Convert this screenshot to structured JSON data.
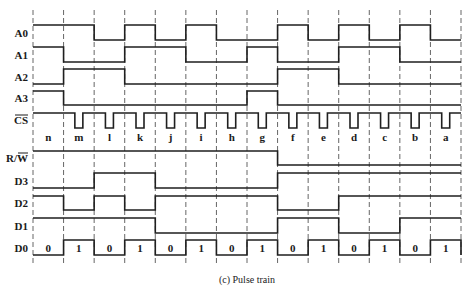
{
  "figure": {
    "caption": "(c) Pulse train",
    "grid": {
      "x_start": 33,
      "x_end": 461,
      "intervals": 14,
      "y_top": 10,
      "y_bottom": 265
    },
    "segments": [
      "n",
      "m",
      "l",
      "k",
      "j",
      "i",
      "h",
      "g",
      "f",
      "e",
      "d",
      "c",
      "b",
      "a"
    ],
    "signals": [
      {
        "name": "A0",
        "label": "A0",
        "overbar": false,
        "high_y": 25,
        "low_y": 40,
        "label_y": 37,
        "levels": [
          1,
          1,
          0,
          1,
          0,
          1,
          0,
          0,
          1,
          0,
          1,
          0,
          1,
          0
        ]
      },
      {
        "name": "A1",
        "label": "A1",
        "overbar": false,
        "high_y": 47,
        "low_y": 62,
        "label_y": 59,
        "levels": [
          1,
          0,
          0,
          1,
          1,
          0,
          0,
          1,
          0,
          0,
          1,
          1,
          0,
          0
        ]
      },
      {
        "name": "A2",
        "label": "A2",
        "overbar": false,
        "high_y": 69,
        "low_y": 84,
        "label_y": 81,
        "levels": [
          0,
          1,
          1,
          0,
          0,
          0,
          0,
          0,
          1,
          1,
          0,
          0,
          0,
          0
        ]
      },
      {
        "name": "A3",
        "label": "A3",
        "overbar": false,
        "high_y": 91,
        "low_y": 105,
        "label_y": 102,
        "levels": [
          1,
          0,
          0,
          0,
          0,
          0,
          0,
          1,
          0,
          0,
          0,
          0,
          0,
          0
        ]
      },
      {
        "name": "CS",
        "label": "CS",
        "overbar": true,
        "high_y": 113,
        "low_y": 128,
        "label_y": 124,
        "type": "pulse",
        "pulse_segments": [
          1,
          2,
          3,
          4,
          5,
          6,
          7,
          8,
          9,
          10,
          11,
          12,
          13
        ],
        "pulse_width": 8
      },
      {
        "name": "RW",
        "label": "R/W",
        "overbar_part": "W",
        "high_y": 151,
        "low_y": 165,
        "label_y": 162,
        "levels": [
          1,
          1,
          1,
          1,
          1,
          1,
          1,
          1,
          0,
          0,
          0,
          0,
          0,
          0
        ]
      },
      {
        "name": "D3",
        "label": "D3",
        "overbar": false,
        "high_y": 173,
        "low_y": 188,
        "label_y": 185,
        "levels": [
          0,
          0,
          1,
          1,
          0,
          0,
          0,
          0,
          1,
          1,
          1,
          1,
          1,
          1
        ]
      },
      {
        "name": "D2",
        "label": "D2",
        "overbar": false,
        "high_y": 196,
        "low_y": 210,
        "label_y": 207,
        "levels": [
          1,
          0,
          1,
          0,
          1,
          1,
          1,
          1,
          0,
          0,
          1,
          1,
          1,
          1
        ]
      },
      {
        "name": "D1",
        "label": "D1",
        "overbar": false,
        "high_y": 218,
        "low_y": 233,
        "label_y": 230,
        "levels": [
          1,
          1,
          1,
          1,
          0,
          0,
          0,
          0,
          1,
          1,
          0,
          0,
          1,
          1
        ]
      },
      {
        "name": "D0",
        "label": "D0",
        "overbar": false,
        "high_y": 240,
        "low_y": 255,
        "label_y": 252,
        "levels": [
          0,
          1,
          0,
          1,
          0,
          1,
          0,
          1,
          0,
          1,
          0,
          1,
          0,
          1
        ],
        "bit_labels": [
          "0",
          "1",
          "0",
          "1",
          "0",
          "1",
          "0",
          "1",
          "0",
          "1",
          "0",
          "1",
          "0",
          "1"
        ]
      }
    ],
    "segment_label_y": 141
  }
}
